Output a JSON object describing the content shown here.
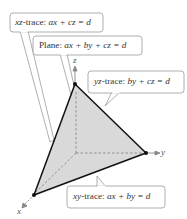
{
  "diagram": {
    "axes": {
      "x_label": "x",
      "y_label": "y",
      "z_label": "z"
    },
    "callouts": {
      "xz_trace": {
        "prefix": "xz",
        "text": "-trace: ",
        "equation": "ax + cz = d"
      },
      "plane": {
        "prefix": "Plane: ",
        "equation": "ax + by + cz = d"
      },
      "yz_trace": {
        "prefix": "yz",
        "text": "-trace: ",
        "equation": "by + cz = d"
      },
      "xy_trace": {
        "prefix": "xy",
        "text": "-trace: ",
        "equation": "ax + by = d"
      }
    },
    "vertices": {
      "z_intercept": [
        75,
        84
      ],
      "y_intercept": [
        146,
        153
      ],
      "x_intercept": [
        34,
        195
      ],
      "origin": [
        76,
        153
      ]
    },
    "colors": {
      "plane_fill": "#d9d9d9",
      "edge": "#111111",
      "dashed_axis": "#888888",
      "callout_border": "#9a9a9a",
      "callout_fill": "#ffffff"
    }
  }
}
